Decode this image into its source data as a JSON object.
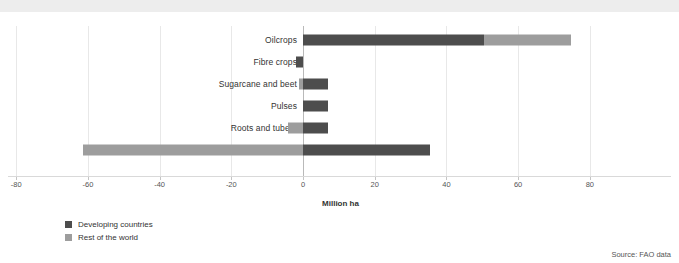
{
  "chart_data": {
    "type": "bar",
    "orientation": "horizontal",
    "stacked": true,
    "title": "",
    "xlabel": "Million ha",
    "ylabel": "",
    "xlim": [
      -80,
      85
    ],
    "xticks": [
      -80,
      -60,
      -40,
      -20,
      0,
      20,
      40,
      60,
      80
    ],
    "xtick_labels": [
      "-80",
      "-60",
      "-40",
      "-20",
      "0",
      "20",
      "40",
      "60",
      "80"
    ],
    "grid": true,
    "legend_position": "bottom-left",
    "categories": [
      "Oilcrops",
      "Fibre crops",
      "Sugarcane and beet",
      "Pulses",
      "Roots and tubers",
      "Cereals"
    ],
    "series": [
      {
        "name": "Developing countries",
        "color": "#4d4d4d",
        "values": [
          50.5,
          -2.0,
          7.0,
          7.0,
          7.0,
          35.3
        ]
      },
      {
        "name": "Rest of the world",
        "color": "#9d9d9d",
        "values": [
          24.2,
          0.0,
          -1.2,
          0.0,
          -4.2,
          -61.4
        ]
      }
    ],
    "source": "Source: FAO data"
  },
  "chart": {
    "xlabel": "Million ha",
    "source": "Source: FAO data"
  },
  "legend": {
    "items": [
      {
        "label": "Developing countries",
        "color": "#4d4d4d"
      },
      {
        "label": "Rest of the world",
        "color": "#9d9d9d"
      }
    ]
  },
  "colors": {
    "developing": "#4d4d4d",
    "rest_of_world": "#9d9d9d",
    "top_band": "#ededed",
    "gridline": "#e8e8e8",
    "zeroline": "#b9b9b9",
    "text": "#333333"
  }
}
